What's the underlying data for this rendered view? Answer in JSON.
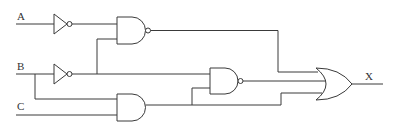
{
  "diagram": {
    "type": "logic-circuit",
    "inputs": [
      {
        "id": "A",
        "label": "A"
      },
      {
        "id": "B",
        "label": "B"
      },
      {
        "id": "C",
        "label": "C"
      }
    ],
    "output": {
      "id": "X",
      "label": "X"
    },
    "gates": [
      {
        "id": "not1",
        "type": "NOT",
        "in": [
          "A"
        ]
      },
      {
        "id": "not2",
        "type": "NOT",
        "in": [
          "B"
        ]
      },
      {
        "id": "nand1",
        "type": "NAND",
        "in": [
          "not1",
          "not2"
        ]
      },
      {
        "id": "and1",
        "type": "AND",
        "in": [
          "B",
          "C"
        ]
      },
      {
        "id": "nand2",
        "type": "NAND",
        "in": [
          "not2",
          "and1"
        ]
      },
      {
        "id": "or1",
        "type": "OR",
        "in": [
          "nand1",
          "nand2",
          "and1"
        ],
        "out": "X"
      }
    ],
    "colors": {
      "stroke": "#3a3a3a",
      "background": "#ffffff"
    }
  }
}
